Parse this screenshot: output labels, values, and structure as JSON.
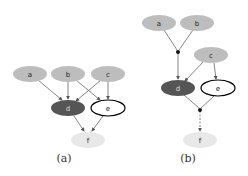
{
  "colors": {
    "light_node": "#bdbdbd",
    "dark_node": "#555555",
    "open_node_fill": "#ffffff",
    "open_node_stroke": "#000000",
    "target_node": "#e8e8e8",
    "edge": "#666666"
  },
  "panels": [
    {
      "caption": "(a)",
      "nodes": [
        {
          "id": "a",
          "label": "a",
          "style": "light"
        },
        {
          "id": "b",
          "label": "b",
          "style": "light"
        },
        {
          "id": "c",
          "label": "c",
          "style": "light"
        },
        {
          "id": "d",
          "label": "d",
          "style": "dark"
        },
        {
          "id": "e",
          "label": "e",
          "style": "open"
        },
        {
          "id": "f",
          "label": "f",
          "style": "target"
        }
      ],
      "edges": [
        [
          "a",
          "d"
        ],
        [
          "b",
          "d"
        ],
        [
          "b",
          "e"
        ],
        [
          "c",
          "d"
        ],
        [
          "c",
          "e"
        ],
        [
          "d",
          "f"
        ],
        [
          "e",
          "f"
        ]
      ]
    },
    {
      "caption": "(b)",
      "nodes": [
        {
          "id": "a",
          "label": "a",
          "style": "light"
        },
        {
          "id": "b",
          "label": "b",
          "style": "light"
        },
        {
          "id": "c",
          "label": "c",
          "style": "light"
        },
        {
          "id": "d",
          "label": "d",
          "style": "dark"
        },
        {
          "id": "e",
          "label": "e",
          "style": "open"
        },
        {
          "id": "f",
          "label": "f",
          "style": "target"
        }
      ],
      "junctions": [
        "j1",
        "j2"
      ],
      "edges": [
        [
          "a",
          "j1"
        ],
        [
          "b",
          "j1"
        ],
        [
          "j1",
          "d"
        ],
        [
          "c",
          "d"
        ],
        [
          "c",
          "e"
        ],
        [
          "d",
          "j2"
        ],
        [
          "e",
          "j2"
        ],
        [
          "j2",
          "f"
        ]
      ]
    }
  ]
}
